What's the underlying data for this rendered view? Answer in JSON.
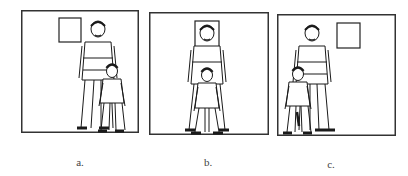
{
  "figure": {
    "panels": [
      {
        "label": "a.",
        "arrangement": "window top-left-center, adult and child at right; child in front-right of adult"
      },
      {
        "label": "b.",
        "arrangement": "window directly behind adult's head, child directly in front of adult, centered"
      },
      {
        "label": "c.",
        "arrangement": "window top-right, adult and child at left; child in front-left of adult"
      }
    ],
    "colors": {
      "line": "#1a1a1a",
      "frame": "#333333",
      "background": "#ffffff"
    }
  }
}
